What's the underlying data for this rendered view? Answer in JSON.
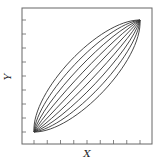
{
  "chart_data": {
    "type": "line",
    "title": "",
    "xlabel": "X",
    "ylabel": "Y",
    "grid": false,
    "legend": null,
    "xlim": [
      0,
      1
    ],
    "ylim": [
      0,
      1
    ],
    "x_ticks": 9,
    "y_ticks": 9,
    "tick_labels_shown": false,
    "series": [
      {
        "name": "curve-1",
        "bulge": -4
      },
      {
        "name": "curve-2",
        "bulge": -3
      },
      {
        "name": "curve-3",
        "bulge": -2
      },
      {
        "name": "curve-4",
        "bulge": -1
      },
      {
        "name": "curve-5",
        "bulge": 0
      },
      {
        "name": "curve-6",
        "bulge": 1
      },
      {
        "name": "curve-7",
        "bulge": 2
      },
      {
        "name": "curve-8",
        "bulge": 3
      },
      {
        "name": "curve-9",
        "bulge": 4
      }
    ],
    "start_point": [
      0,
      0
    ],
    "end_point": [
      1,
      1
    ]
  },
  "colors": {
    "frame": "#555555",
    "curves": "#333333",
    "background": "#ffffff"
  }
}
